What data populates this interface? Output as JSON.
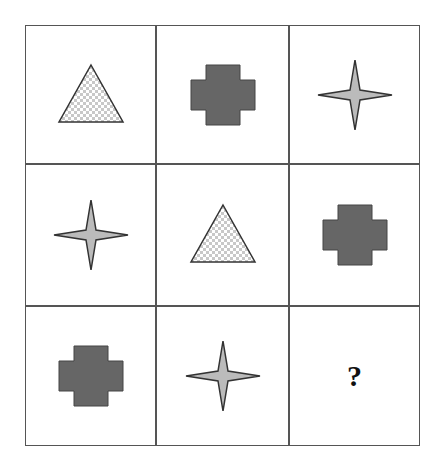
{
  "puzzle": {
    "rows": 3,
    "cols": 3,
    "cells": [
      {
        "row": 0,
        "col": 0,
        "shape": "triangle",
        "fill": "checkered"
      },
      {
        "row": 0,
        "col": 1,
        "shape": "cross",
        "fill": "dark-gray"
      },
      {
        "row": 0,
        "col": 2,
        "shape": "four-point-star",
        "fill": "light-gray"
      },
      {
        "row": 1,
        "col": 0,
        "shape": "four-point-star",
        "fill": "light-gray"
      },
      {
        "row": 1,
        "col": 1,
        "shape": "triangle",
        "fill": "checkered"
      },
      {
        "row": 1,
        "col": 2,
        "shape": "cross",
        "fill": "dark-gray"
      },
      {
        "row": 2,
        "col": 0,
        "shape": "cross",
        "fill": "dark-gray"
      },
      {
        "row": 2,
        "col": 1,
        "shape": "four-point-star",
        "fill": "light-gray"
      },
      {
        "row": 2,
        "col": 2,
        "shape": "unknown",
        "label": "?"
      }
    ],
    "question_mark": "?"
  },
  "colors": {
    "border": "#555555",
    "cross_fill": "#666666",
    "star_fill": "#bbbbbb",
    "checker_light": "#ffffff",
    "checker_dark": "#c8c8c8",
    "outline": "#333333"
  }
}
